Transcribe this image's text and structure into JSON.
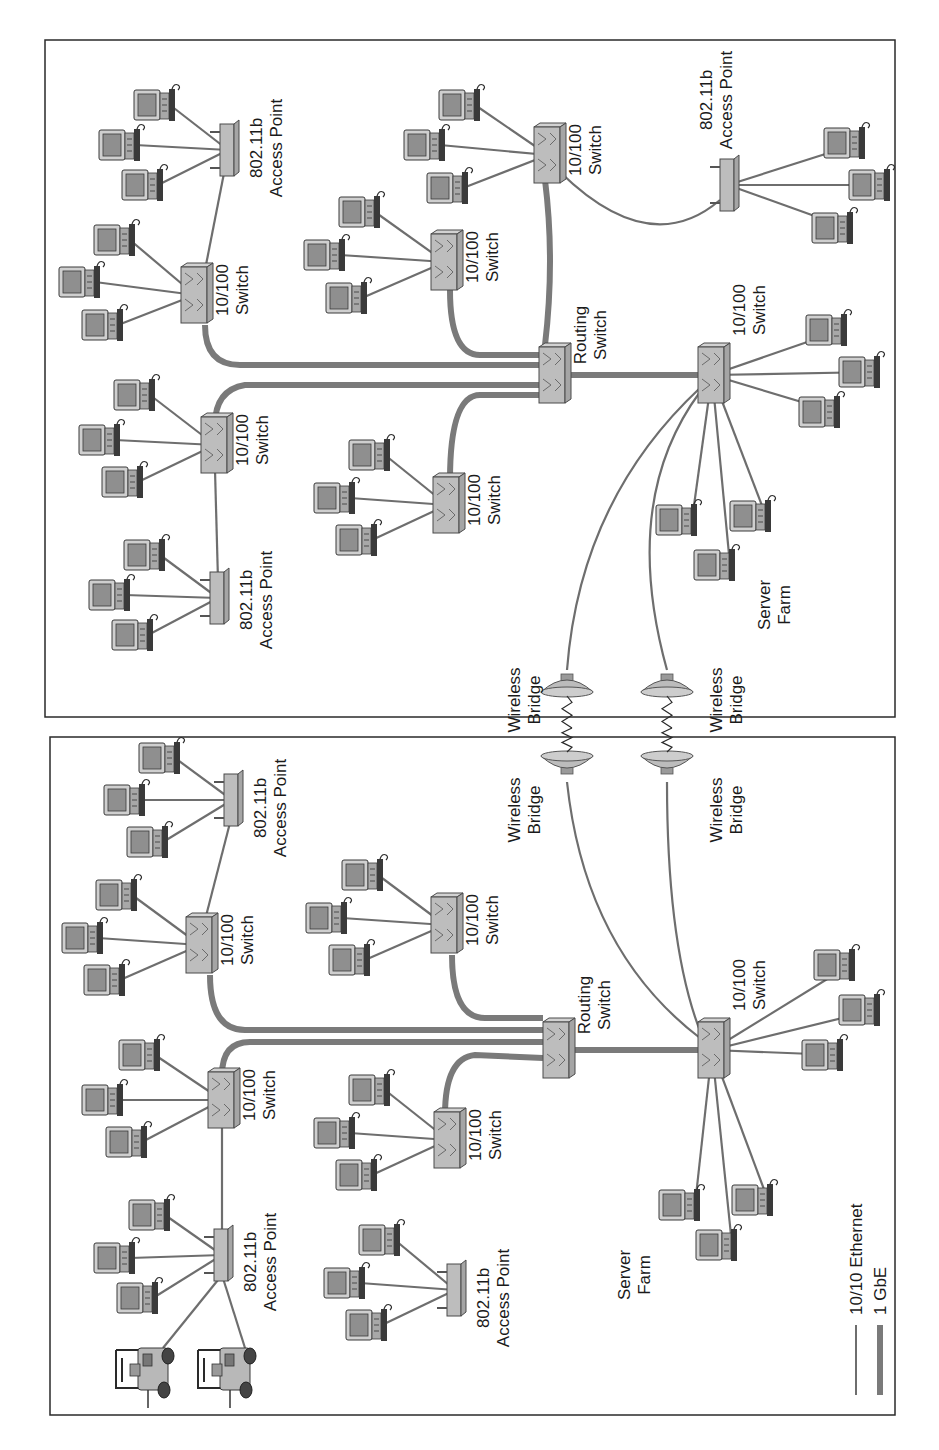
{
  "figure": {
    "orientation": "rotated-90-ccw",
    "colors": {
      "ethernet_line": "#6e6e6e",
      "gbe_line": "#7a7a7a",
      "device_fill": "#bdbdbd",
      "screen_fill": "#8f8f8f",
      "border": "#2a2a2a"
    }
  },
  "legend": {
    "items": [
      {
        "label": "10/10 Ethernet",
        "style": "thin"
      },
      {
        "label": "1 GbE",
        "style": "thick"
      }
    ]
  },
  "panels": [
    {
      "name": "site-a",
      "box": [
        45,
        40,
        850,
        677
      ],
      "switches": [
        {
          "id": "sw-a",
          "x": 195,
          "y": 295,
          "label": [
            "10/100",
            "Switch"
          ],
          "lx": 228,
          "ly": 290
        },
        {
          "id": "sw-b",
          "x": 215,
          "y": 445,
          "label": [
            "10/100",
            "Switch"
          ],
          "lx": 248,
          "ly": 440
        },
        {
          "id": "sw-c",
          "x": 445,
          "y": 262,
          "label": [
            "10/100",
            "Switch"
          ],
          "lx": 478,
          "ly": 257
        },
        {
          "id": "routing",
          "x": 553,
          "y": 375,
          "label": [
            "Routing",
            "Switch"
          ],
          "lx": 586,
          "ly": 335
        },
        {
          "id": "sw-d",
          "x": 447,
          "y": 505,
          "label": [
            "10/100",
            "Switch"
          ],
          "lx": 480,
          "ly": 500
        },
        {
          "id": "sw-e",
          "x": 548,
          "y": 155,
          "label": [
            "10/100",
            "Switch"
          ],
          "lx": 581,
          "ly": 150
        },
        {
          "id": "sw-f",
          "x": 712,
          "y": 375,
          "label": [
            "10/100",
            "Switch"
          ],
          "lx": 745,
          "ly": 310
        }
      ],
      "access_points": [
        {
          "id": "ap-1",
          "x": 228,
          "y": 150,
          "label": [
            "802.11b",
            "Access Point"
          ],
          "lx": 262,
          "ly": 148
        },
        {
          "id": "ap-2",
          "x": 218,
          "y": 598,
          "label": [
            "802.11b",
            "Access Point"
          ],
          "lx": 252,
          "ly": 600
        },
        {
          "id": "ap-3",
          "x": 728,
          "y": 185,
          "label": [
            "802.11b",
            "Access Point"
          ],
          "lx": 712,
          "ly": 100
        }
      ],
      "pcs": [
        {
          "x": 150,
          "y": 105,
          "to": "ap-1"
        },
        {
          "x": 115,
          "y": 145,
          "to": "ap-1"
        },
        {
          "x": 138,
          "y": 185,
          "to": "ap-1"
        },
        {
          "x": 110,
          "y": 240,
          "to": "sw-a"
        },
        {
          "x": 75,
          "y": 282,
          "to": "sw-a"
        },
        {
          "x": 98,
          "y": 325,
          "to": "sw-a"
        },
        {
          "x": 130,
          "y": 395,
          "to": "sw-b"
        },
        {
          "x": 95,
          "y": 440,
          "to": "sw-b"
        },
        {
          "x": 118,
          "y": 482,
          "to": "sw-b"
        },
        {
          "x": 140,
          "y": 555,
          "to": "ap-2"
        },
        {
          "x": 105,
          "y": 595,
          "to": "ap-2"
        },
        {
          "x": 128,
          "y": 635,
          "to": "ap-2"
        },
        {
          "x": 355,
          "y": 212,
          "to": "sw-c"
        },
        {
          "x": 320,
          "y": 255,
          "to": "sw-c"
        },
        {
          "x": 342,
          "y": 298,
          "to": "sw-c"
        },
        {
          "x": 365,
          "y": 455,
          "to": "sw-d"
        },
        {
          "x": 330,
          "y": 498,
          "to": "sw-d"
        },
        {
          "x": 352,
          "y": 540,
          "to": "sw-d"
        },
        {
          "x": 455,
          "y": 105,
          "to": "sw-e"
        },
        {
          "x": 420,
          "y": 145,
          "to": "sw-e"
        },
        {
          "x": 443,
          "y": 188,
          "to": "sw-e"
        },
        {
          "x": 840,
          "y": 143,
          "to": "ap-3"
        },
        {
          "x": 865,
          "y": 185,
          "to": "ap-3"
        },
        {
          "x": 828,
          "y": 228,
          "to": "ap-3"
        },
        {
          "x": 822,
          "y": 330,
          "to": "sw-f"
        },
        {
          "x": 855,
          "y": 372,
          "to": "sw-f"
        },
        {
          "x": 815,
          "y": 412,
          "to": "sw-f"
        },
        {
          "x": 672,
          "y": 520,
          "to": "sw-f"
        },
        {
          "x": 710,
          "y": 565,
          "to": "sw-f"
        },
        {
          "x": 746,
          "y": 516,
          "to": "sw-f"
        }
      ],
      "gbe_links": [
        "M 205 325 Q 205 365 240 365 L 540 365",
        "M 215 425 Q 215 390 245 385 L 540 385",
        "M 450 290 Q 450 355 480 355 L 540 355",
        "M 450 480 Q 450 395 480 395 L 540 395",
        "M 545 345 Q 555 260 545 180",
        "M 570 375 L 700 375"
      ],
      "eth_links": [
        "M 205 270 L 225 168",
        "M 215 470 L 218 580",
        "M 560 172 Q 650 260 720 200",
        "M 700 388 Q 580 500 567 670",
        "M 700 392 Q 620 500 667 670"
      ],
      "bridges": [
        {
          "x": 567,
          "y": 690,
          "dir": "down",
          "label": [
            "Wireless",
            "Bridge"
          ],
          "lx": 520,
          "ly": 700
        },
        {
          "x": 667,
          "y": 690,
          "dir": "down",
          "label": [
            "Wireless",
            "Bridge"
          ],
          "lx": 722,
          "ly": 700
        }
      ],
      "text_labels": [
        {
          "lines": [
            "Server",
            "Farm"
          ],
          "x": 770,
          "y": 605
        }
      ]
    },
    {
      "name": "site-b",
      "box": [
        50,
        737,
        845,
        678
      ],
      "switches": [
        {
          "id": "sw-g",
          "x": 200,
          "y": 945,
          "label": [
            "10/100",
            "Switch"
          ],
          "lx": 233,
          "ly": 940
        },
        {
          "id": "sw-h",
          "x": 222,
          "y": 1100,
          "label": [
            "10/100",
            "Switch"
          ],
          "lx": 255,
          "ly": 1095
        },
        {
          "id": "sw-i",
          "x": 445,
          "y": 925,
          "label": [
            "10/100",
            "Switch"
          ],
          "lx": 478,
          "ly": 920
        },
        {
          "id": "routing-b",
          "x": 557,
          "y": 1050,
          "label": [
            "Routing",
            "Switch"
          ],
          "lx": 590,
          "ly": 1005
        },
        {
          "id": "sw-j",
          "x": 448,
          "y": 1140,
          "label": [
            "10/100",
            "Switch"
          ],
          "lx": 481,
          "ly": 1135
        },
        {
          "id": "sw-k",
          "x": 712,
          "y": 1050,
          "label": [
            "10/100",
            "Switch"
          ],
          "lx": 745,
          "ly": 985
        }
      ],
      "access_points": [
        {
          "id": "ap-4",
          "x": 232,
          "y": 800,
          "label": [
            "802.11b",
            "Access Point"
          ],
          "lx": 266,
          "ly": 808
        },
        {
          "id": "ap-5",
          "x": 222,
          "y": 1255,
          "label": [
            "802.11b",
            "Access Point"
          ],
          "lx": 256,
          "ly": 1262
        },
        {
          "id": "ap-6",
          "x": 455,
          "y": 1290,
          "label": [
            "802.11b",
            "Access Point"
          ],
          "lx": 489,
          "ly": 1298
        }
      ],
      "pcs": [
        {
          "x": 155,
          "y": 758,
          "to": "ap-4"
        },
        {
          "x": 120,
          "y": 800,
          "to": "ap-4"
        },
        {
          "x": 143,
          "y": 842,
          "to": "ap-4"
        },
        {
          "x": 112,
          "y": 895,
          "to": "sw-g"
        },
        {
          "x": 78,
          "y": 938,
          "to": "sw-g"
        },
        {
          "x": 100,
          "y": 980,
          "to": "sw-g"
        },
        {
          "x": 135,
          "y": 1055,
          "to": "sw-h"
        },
        {
          "x": 98,
          "y": 1100,
          "to": "sw-h"
        },
        {
          "x": 122,
          "y": 1142,
          "to": "sw-h"
        },
        {
          "x": 145,
          "y": 1215,
          "to": "ap-5"
        },
        {
          "x": 110,
          "y": 1258,
          "to": "ap-5"
        },
        {
          "x": 133,
          "y": 1298,
          "to": "ap-5"
        },
        {
          "x": 358,
          "y": 875,
          "to": "sw-i"
        },
        {
          "x": 322,
          "y": 918,
          "to": "sw-i"
        },
        {
          "x": 345,
          "y": 960,
          "to": "sw-i"
        },
        {
          "x": 365,
          "y": 1090,
          "to": "sw-j"
        },
        {
          "x": 330,
          "y": 1133,
          "to": "sw-j"
        },
        {
          "x": 352,
          "y": 1175,
          "to": "sw-j"
        },
        {
          "x": 375,
          "y": 1240,
          "to": "ap-6"
        },
        {
          "x": 340,
          "y": 1283,
          "to": "ap-6"
        },
        {
          "x": 362,
          "y": 1325,
          "to": "ap-6"
        },
        {
          "x": 830,
          "y": 965,
          "to": "sw-k"
        },
        {
          "x": 855,
          "y": 1010,
          "to": "sw-k"
        },
        {
          "x": 818,
          "y": 1055,
          "to": "sw-k"
        },
        {
          "x": 675,
          "y": 1205,
          "to": "sw-k"
        },
        {
          "x": 712,
          "y": 1245,
          "to": "sw-k"
        },
        {
          "x": 748,
          "y": 1200,
          "to": "sw-k"
        }
      ],
      "forklifts": [
        {
          "x": 148,
          "y": 1378,
          "to": "ap-5"
        },
        {
          "x": 230,
          "y": 1378,
          "to": "ap-5"
        }
      ],
      "gbe_links": [
        "M 210 975 Q 210 1030 245 1030 L 543 1030",
        "M 222 1075 Q 222 1042 250 1042 L 543 1042",
        "M 452 955 Q 452 1018 485 1018 L 543 1018",
        "M 445 1115 Q 445 1058 475 1055 L 543 1058",
        "M 572 1050 L 700 1050"
      ],
      "eth_links": [
        "M 205 920 L 232 815",
        "M 222 1128 L 222 1238",
        "M 700 1038 Q 585 950 567 782",
        "M 702 1036 Q 667 950 667 782"
      ],
      "bridges": [
        {
          "x": 567,
          "y": 758,
          "dir": "up",
          "label": [
            "Wireless",
            "Bridge"
          ],
          "lx": 520,
          "ly": 810
        },
        {
          "x": 667,
          "y": 758,
          "dir": "up",
          "label": [
            "Wireless",
            "Bridge"
          ],
          "lx": 722,
          "ly": 810
        }
      ],
      "text_labels": [
        {
          "lines": [
            "Server",
            "Farm"
          ],
          "x": 630,
          "y": 1275
        }
      ]
    }
  ]
}
